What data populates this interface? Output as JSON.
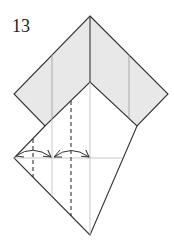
{
  "diagram": {
    "step_number": "13",
    "colors": {
      "paper_colored": "#e8e8e8",
      "paper_white": "#ffffff",
      "edge": "#333333",
      "crease": "#aaaaaa",
      "dashed_fold": "#333333",
      "arrow": "#333333"
    },
    "elements": {
      "colored_band": "gray-band",
      "valley_folds": [
        "valley-fold-left",
        "valley-fold-center"
      ],
      "arrows": [
        "fold-arrow-left",
        "fold-arrow-right"
      ]
    }
  }
}
